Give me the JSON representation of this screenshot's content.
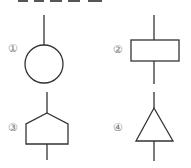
{
  "figures": [
    {
      "label": "①",
      "shape": "circle-icon"
    },
    {
      "label": "②",
      "shape": "rectangle-icon"
    },
    {
      "label": "③",
      "shape": "pentagon-icon"
    },
    {
      "label": "④",
      "shape": "triangle-icon"
    }
  ],
  "colors": {
    "stroke": "#333333",
    "label": "#777777"
  }
}
